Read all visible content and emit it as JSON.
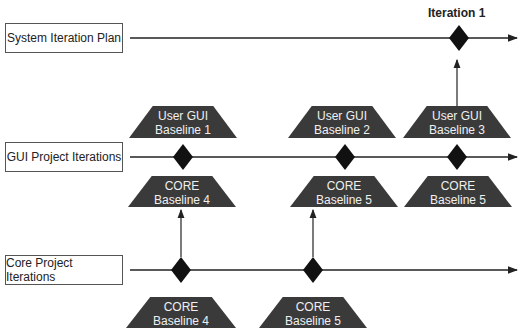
{
  "diagram": {
    "lanes": [
      {
        "label": "System Iteration Plan"
      },
      {
        "label": "GUI Project Iterations"
      },
      {
        "label": "Core Project Iterations"
      }
    ],
    "iteration_label": "Iteration 1",
    "gui_baselines_above": [
      {
        "line1": "User GUI",
        "line2": "Baseline 1"
      },
      {
        "line1": "User GUI",
        "line2": "Baseline 2"
      },
      {
        "line1": "User GUI",
        "line2": "Baseline 3"
      }
    ],
    "gui_baselines_below": [
      {
        "line1": "CORE",
        "line2": "Baseline 4"
      },
      {
        "line1": "CORE",
        "line2": "Baseline 5"
      },
      {
        "line1": "CORE",
        "line2": "Baseline 5"
      }
    ],
    "core_baselines": [
      {
        "line1": "CORE",
        "line2": "Baseline 4"
      },
      {
        "line1": "CORE",
        "line2": "Baseline 5"
      }
    ],
    "colors": {
      "milestone": "#111111",
      "baseline_fill": "#3a3a3a",
      "line": "#222222"
    }
  }
}
